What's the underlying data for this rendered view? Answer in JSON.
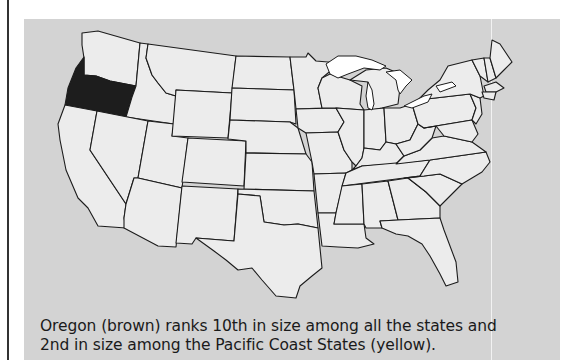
{
  "figure": {
    "caption_line1": "Oregon (brown) ranks 10th in size among all the states and",
    "caption_line2": "2nd in size among the Pacific Coast States (yellow).",
    "highlighted_state": "Oregon",
    "colors": {
      "background": "#ffffff",
      "panel": "#d3d3d3",
      "state_fill": "#ececec",
      "highlight_fill": "#1d1d1d",
      "border": "#1c1c1c"
    }
  }
}
